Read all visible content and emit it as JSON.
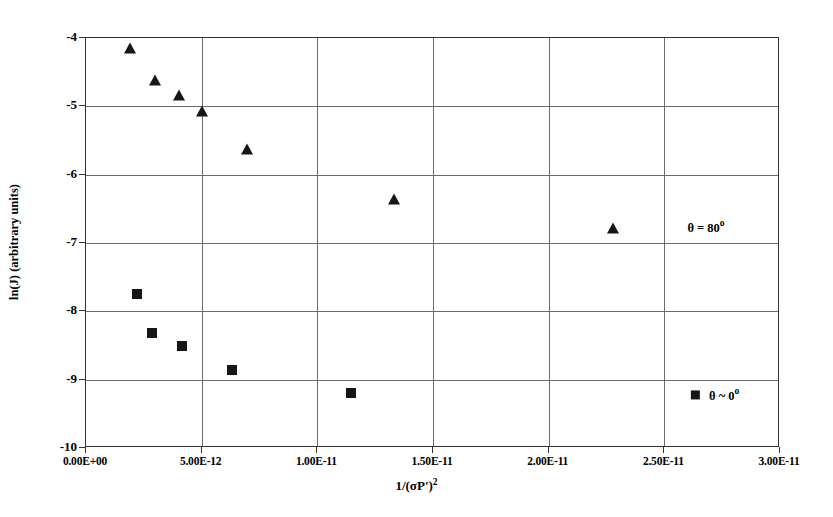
{
  "chart_data": {
    "type": "scatter",
    "title": "",
    "xlabel": "1/(σP')²",
    "ylabel": "ln(J) (arbitrary units)",
    "xlim": [
      0,
      3e-11
    ],
    "ylim": [
      -10,
      -4
    ],
    "grid": true,
    "legend_position": "inside-right",
    "xticks": [
      "0.00E+00",
      "5.00E-12",
      "1.00E-11",
      "1.50E-11",
      "2.00E-11",
      "2.50E-11",
      "3.00E-11"
    ],
    "xtick_values": [
      0,
      5e-12,
      1e-11,
      1.5e-11,
      2e-11,
      2.5e-11,
      3e-11
    ],
    "yticks": [
      "-4",
      "-5",
      "-6",
      "-7",
      "-8",
      "-9",
      "-10"
    ],
    "ytick_values": [
      -4,
      -5,
      -6,
      -7,
      -8,
      -9,
      -10
    ],
    "series": [
      {
        "name": "θ = 80°",
        "marker": "triangle",
        "color": "#161616",
        "points": [
          {
            "x": 1.9e-12,
            "y": -4.15
          },
          {
            "x": 3e-12,
            "y": -4.61
          },
          {
            "x": 4e-12,
            "y": -4.83
          },
          {
            "x": 5e-12,
            "y": -5.07
          },
          {
            "x": 6.95e-12,
            "y": -5.62
          },
          {
            "x": 1.33e-11,
            "y": -6.36
          },
          {
            "x": 2.28e-11,
            "y": -6.78
          }
        ]
      },
      {
        "name": "θ ~ 0°",
        "marker": "square",
        "color": "#161616",
        "points": [
          {
            "x": 2.2e-12,
            "y": -7.75
          },
          {
            "x": 2.85e-12,
            "y": -8.31
          },
          {
            "x": 4.15e-12,
            "y": -8.5
          },
          {
            "x": 6.3e-12,
            "y": -8.86
          },
          {
            "x": 1.145e-11,
            "y": -9.19
          }
        ]
      }
    ],
    "annotations": [
      {
        "id": "theta-80",
        "text_main": "θ = 80",
        "text_sup": "o",
        "show_swatch": false,
        "x": 2.68e-11,
        "y": -6.77
      },
      {
        "id": "theta-0",
        "text_main": "θ ~ 0",
        "text_sup": "o",
        "show_swatch": true,
        "x": 2.72e-11,
        "y": -9.22
      }
    ]
  },
  "axis_title_x": {
    "prefix": "1/(σP')",
    "exponent": "2"
  },
  "axis_title_y": "ln(J) (arbitrary units)"
}
